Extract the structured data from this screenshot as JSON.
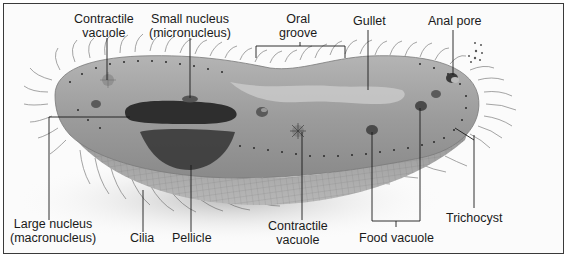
{
  "diagram": {
    "colors": {
      "frame": "#3a3a3a",
      "body": "#9a9a9a",
      "body_dark": "#6e6e6e",
      "macronucleus": "#2e2e2e",
      "leader": "#1a1a1a",
      "background": "#fbfbfb"
    },
    "labels": {
      "contractile_vacuole_top": {
        "line1": "Contractile",
        "line2": "vacuole"
      },
      "micronucleus": {
        "line1": "Small nucleus",
        "line2": "(micronucleus)"
      },
      "oral_groove": {
        "line1": "Oral",
        "line2": "groove"
      },
      "gullet": {
        "line1": "Gullet"
      },
      "anal_pore": {
        "line1": "Anal pore"
      },
      "macronucleus": {
        "line1": "Large nucleus",
        "line2": "(macronucleus)"
      },
      "cilia": {
        "line1": "Cilia"
      },
      "pellicle": {
        "line1": "Pellicle"
      },
      "contractile_vacuole_bottom": {
        "line1": "Contractile",
        "line2": "vacuole"
      },
      "food_vacuole": {
        "line1": "Food vacuole"
      },
      "trichocyst": {
        "line1": "Trichocyst"
      }
    }
  }
}
